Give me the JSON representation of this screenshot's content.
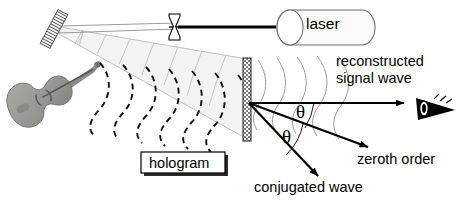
{
  "figure": {
    "type": "optics-diagram",
    "topic": "holographic reconstruction",
    "background": "#ffffff",
    "ink": "#000000"
  },
  "components": {
    "laser": {
      "label": "laser",
      "icon": "laser-cylinder-icon",
      "shape": "cylinder"
    },
    "lens": {
      "icon": "concave-lens-icon",
      "shape": "hourglass"
    },
    "mirror": {
      "icon": "mirror-grating-icon",
      "shape": "hatched-diagonal-bar"
    },
    "hologram": {
      "label": "hologram",
      "icon": "hologram-plate-icon",
      "shape": "hatched-vertical-plate"
    },
    "object": {
      "icon": "violin-icon",
      "shape": "violin-photo"
    },
    "observer": {
      "icon": "eye-icon",
      "shape": "eye-triangle"
    }
  },
  "labels": {
    "laser": "laser",
    "hologram": "hologram",
    "reconstructed_line1": "reconstructed",
    "reconstructed_line2": "signal wave",
    "zeroth_order": "zeroth order",
    "conjugated_wave": "conjugated wave",
    "theta_upper": "θ",
    "theta_lower": "θ"
  },
  "beams": {
    "illumination": "expanding reference beam from mirror to hologram plate",
    "object_wavefronts": "dashed curved wavefronts scattered from violin",
    "reconstructed_wavefronts": "thin curved wavefronts right of plate",
    "rays": [
      {
        "name": "reconstructed-signal-ray",
        "direction": "horizontal-right"
      },
      {
        "name": "zeroth-order-ray",
        "direction": "down-right-shallow"
      },
      {
        "name": "conjugated-wave-ray",
        "direction": "down-right-steep"
      }
    ]
  },
  "colors": {
    "ink": "#000000",
    "beam_fill": "#f2f2f2",
    "beam_stroke": "#b5b5b5",
    "violin_body": "#9b9a97",
    "violin_dark": "#6d6c6a",
    "plate_hatch": "#4a4a4a"
  }
}
